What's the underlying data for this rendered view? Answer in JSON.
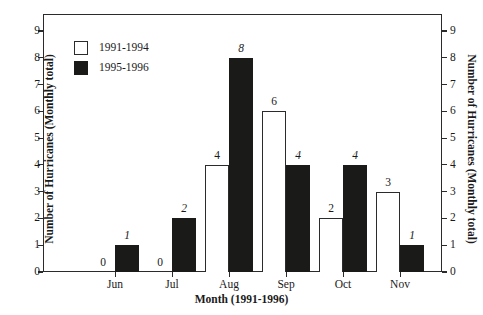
{
  "chart_data": {
    "type": "bar",
    "title": "",
    "xlabel": "Month (1991-1996)",
    "ylabel": "Number of Hurricanes (Monthly total)",
    "ylabel_right": "Number of Hurricanes (Monthly total)",
    "categories": [
      "Jun",
      "Jul",
      "Aug",
      "Sep",
      "Oct",
      "Nov"
    ],
    "series": [
      {
        "name": "1991-1994",
        "color": "#ffffff",
        "values": [
          0,
          0,
          4,
          6,
          2,
          3
        ]
      },
      {
        "name": "1995-1996",
        "color": "#1a1a18",
        "values": [
          1,
          2,
          8,
          4,
          4,
          1
        ]
      }
    ],
    "ylim": [
      0,
      9.5
    ],
    "yticks": [
      0,
      1,
      2,
      3,
      4,
      5,
      6,
      7,
      8,
      9
    ],
    "ytick_labels": [
      "0",
      "1",
      "2",
      "3",
      "4",
      "5",
      "6",
      "7",
      "8",
      "9"
    ],
    "grid": false,
    "legend_position": "upper-left",
    "value_labels_shown": true,
    "value_label_style": {
      "series_1": "upright",
      "series_2": "italic"
    },
    "data_labels": [
      {
        "category": "Jun",
        "series": "1991-1994",
        "label": "0"
      },
      {
        "category": "Jun",
        "series": "1995-1996",
        "label": "1"
      },
      {
        "category": "Jul",
        "series": "1991-1994",
        "label": "0"
      },
      {
        "category": "Jul",
        "series": "1995-1996",
        "label": "2"
      },
      {
        "category": "Aug",
        "series": "1991-1994",
        "label": "4"
      },
      {
        "category": "Aug",
        "series": "1995-1996",
        "label": "8"
      },
      {
        "category": "Sep",
        "series": "1991-1994",
        "label": "6"
      },
      {
        "category": "Sep",
        "series": "1995-1996",
        "label": "4"
      },
      {
        "category": "Oct",
        "series": "1991-1994",
        "label": "2"
      },
      {
        "category": "Oct",
        "series": "1995-1996",
        "label": "4"
      },
      {
        "category": "Nov",
        "series": "1991-1994",
        "label": "3"
      },
      {
        "category": "Nov",
        "series": "1995-1996",
        "label": "1"
      }
    ]
  },
  "legend": {
    "entries": [
      {
        "label": "1991-1994",
        "swatch": "white"
      },
      {
        "label": "1995-1996",
        "swatch": "black"
      }
    ]
  },
  "axes": {
    "left_title": "Number of Hurricanes (Monthly total)",
    "right_title": "Number of Hurricanes (Monthly total)",
    "bottom_title": "Month (1991-1996)"
  },
  "colors": {
    "frame": "#2b2b2b",
    "bar_light": "#ffffff",
    "bar_dark": "#1a1a18",
    "background": "#ffffff",
    "text": "#1a1a1a"
  }
}
